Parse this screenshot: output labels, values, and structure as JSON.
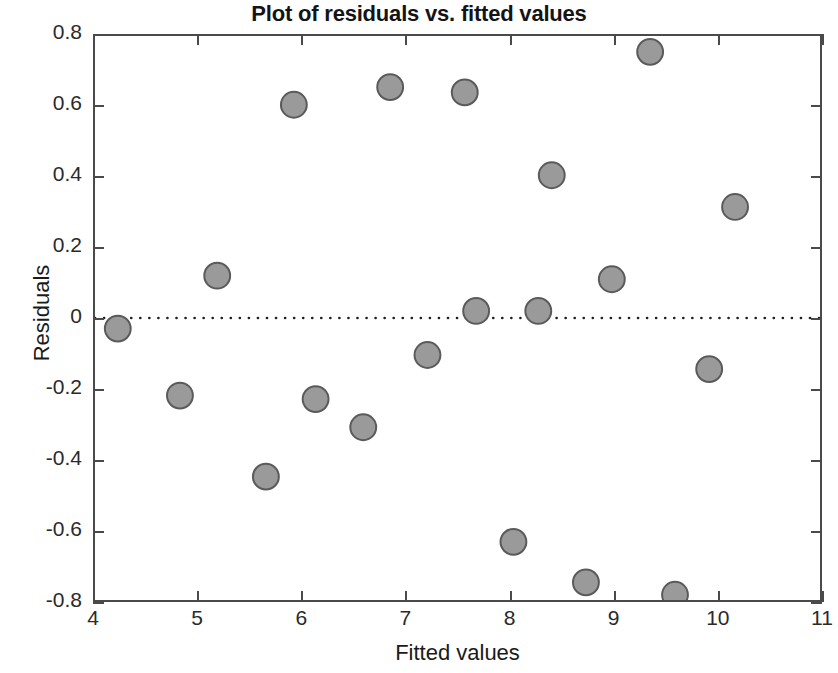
{
  "chart_data": {
    "type": "scatter",
    "title": "Plot of residuals vs. fitted values",
    "xlabel": "Fitted values",
    "ylabel": "Residuals",
    "xlim": [
      4,
      11
    ],
    "ylim": [
      -0.8,
      0.8
    ],
    "xticks": [
      "4",
      "5",
      "6",
      "7",
      "8",
      "9",
      "10",
      "11"
    ],
    "xtick_values": [
      4,
      5,
      6,
      7,
      8,
      9,
      10,
      11
    ],
    "yticks": [
      "0.8",
      "0.6",
      "0.4",
      "0.2",
      "0",
      "-0.2",
      "-0.4",
      "-0.6",
      "-0.8"
    ],
    "ytick_values": [
      0.8,
      0.6,
      0.4,
      0.2,
      0,
      -0.2,
      -0.4,
      -0.6,
      -0.8
    ],
    "grid": false,
    "legend": null,
    "reference_line": {
      "orientation": "horizontal",
      "y": 0,
      "style": "dotted",
      "color": "#1f1f1f"
    },
    "marker": {
      "shape": "circle",
      "fill": "#9a9a9a",
      "edge": "#5a5a5a",
      "size": 13
    },
    "points": [
      {
        "x": 4.22,
        "y": -0.03
      },
      {
        "x": 4.82,
        "y": -0.22
      },
      {
        "x": 5.18,
        "y": 0.12
      },
      {
        "x": 5.65,
        "y": -0.45
      },
      {
        "x": 5.92,
        "y": 0.605
      },
      {
        "x": 6.13,
        "y": -0.23
      },
      {
        "x": 6.59,
        "y": -0.31
      },
      {
        "x": 6.85,
        "y": 0.655
      },
      {
        "x": 7.21,
        "y": -0.105
      },
      {
        "x": 7.57,
        "y": 0.64
      },
      {
        "x": 7.68,
        "y": 0.02
      },
      {
        "x": 8.04,
        "y": -0.635
      },
      {
        "x": 8.28,
        "y": 0.02
      },
      {
        "x": 8.41,
        "y": 0.405
      },
      {
        "x": 8.74,
        "y": -0.75
      },
      {
        "x": 8.99,
        "y": 0.11
      },
      {
        "x": 9.36,
        "y": 0.755
      },
      {
        "x": 9.6,
        "y": -0.785
      },
      {
        "x": 9.93,
        "y": -0.145
      },
      {
        "x": 10.18,
        "y": 0.315
      }
    ]
  }
}
